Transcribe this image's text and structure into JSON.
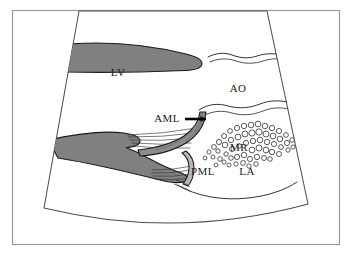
{
  "figure": {
    "kind": "echocardiography-schematic",
    "caption_absent": true,
    "frame": {
      "border_color": "#9a9a9a",
      "background_color": "#ffffff"
    },
    "sector": {
      "name": "ultrasound-sector",
      "outline_color": "#4d4d4d",
      "fill_color": "#ffffff"
    },
    "palette": {
      "myocardium_gray": "#808080",
      "leaflet_gray": "#8c8c8c",
      "outline_dark": "#1a1a1a",
      "outline_thin": "#4d4d4d",
      "bubble_stroke": "#333333",
      "arrow_black": "#000000",
      "text_color": "#1a1a1a"
    }
  },
  "labels": [
    {
      "id": "lv",
      "text": "LV",
      "x": 118,
      "y": 76,
      "size": "large"
    },
    {
      "id": "ao",
      "text": "AO",
      "x": 238,
      "y": 92,
      "size": "large"
    },
    {
      "id": "aml",
      "text": "AML",
      "x": 167,
      "y": 122,
      "size": "large"
    },
    {
      "id": "mr",
      "text": "MR",
      "x": 239,
      "y": 151,
      "size": "large"
    },
    {
      "id": "pml",
      "text": "PML",
      "x": 203,
      "y": 175,
      "size": "large"
    },
    {
      "id": "la",
      "text": "LA",
      "x": 247,
      "y": 175,
      "size": "large"
    }
  ],
  "annotations": {
    "aml_arrow": {
      "name": "aml-pointer-arrow",
      "from_x": 190,
      "from_y": 120,
      "to_x": 208,
      "to_y": 120,
      "color": "#000000"
    }
  },
  "structures": {
    "lv_anterior_wall": "upper gray myocardial band sloping down-right to a rounded tip at the aortic root",
    "lv_posterior_wall": "lower V-shaped gray myocardial band with papillary muscle",
    "anterior_mitral_leaflet": "gray curved leaflet sweeping up toward the aortic root",
    "posterior_mitral_leaflet": "short gray leaflet at the base",
    "chordae_tendineae": "fan of thin lines from papillary muscles to both leaflets",
    "aortic_root_walls": "pair of wavy lines bounding the aorta",
    "left_atrium_posterior_wall": "shallow arc bounding the left atrium inferiorly",
    "mr_jet": "cluster of small open circles representing the mitral regurgitant jet in the left atrium"
  },
  "mr_jet_bubbles": {
    "name": "mr-jet-bubble-cluster",
    "count": 58,
    "radius_min": 1.8,
    "radius_max": 3.4,
    "stroke": "#333333",
    "fill": "#ffffff",
    "points": [
      [
        209,
        152,
        2.1
      ],
      [
        214,
        147,
        2.4
      ],
      [
        213,
        157,
        2.0
      ],
      [
        219,
        142,
        2.6
      ],
      [
        218,
        151,
        2.2
      ],
      [
        220,
        159,
        2.3
      ],
      [
        224,
        136,
        2.5
      ],
      [
        225,
        145,
        2.8
      ],
      [
        226,
        154,
        2.2
      ],
      [
        224,
        162,
        2.1
      ],
      [
        230,
        131,
        2.4
      ],
      [
        231,
        140,
        2.7
      ],
      [
        232,
        149,
        2.5
      ],
      [
        231,
        158,
        2.3
      ],
      [
        229,
        165,
        2.0
      ],
      [
        237,
        128,
        2.6
      ],
      [
        238,
        137,
        2.9
      ],
      [
        239,
        146,
        2.4
      ],
      [
        237,
        157,
        2.6
      ],
      [
        236,
        164,
        2.2
      ],
      [
        244,
        126,
        2.7
      ],
      [
        245,
        134,
        3.0
      ],
      [
        246,
        143,
        2.6
      ],
      [
        244,
        155,
        2.8
      ],
      [
        243,
        163,
        2.4
      ],
      [
        251,
        125,
        2.8
      ],
      [
        252,
        133,
        3.1
      ],
      [
        253,
        141,
        2.7
      ],
      [
        252,
        150,
        2.9
      ],
      [
        250,
        159,
        2.6
      ],
      [
        249,
        166,
        2.2
      ],
      [
        258,
        124,
        2.9
      ],
      [
        259,
        132,
        3.2
      ],
      [
        260,
        140,
        2.8
      ],
      [
        259,
        148,
        3.0
      ],
      [
        257,
        157,
        2.7
      ],
      [
        256,
        164,
        2.3
      ],
      [
        265,
        126,
        2.8
      ],
      [
        266,
        134,
        3.0
      ],
      [
        267,
        142,
        2.7
      ],
      [
        266,
        150,
        2.9
      ],
      [
        264,
        158,
        2.5
      ],
      [
        272,
        128,
        2.7
      ],
      [
        273,
        136,
        2.9
      ],
      [
        274,
        144,
        2.6
      ],
      [
        272,
        152,
        2.7
      ],
      [
        270,
        159,
        2.3
      ],
      [
        279,
        131,
        2.6
      ],
      [
        280,
        139,
        2.8
      ],
      [
        281,
        147,
        2.4
      ],
      [
        279,
        154,
        2.5
      ],
      [
        286,
        135,
        2.4
      ],
      [
        287,
        143,
        2.6
      ],
      [
        288,
        150,
        2.2
      ],
      [
        292,
        140,
        2.3
      ],
      [
        293,
        147,
        2.1
      ],
      [
        216,
        165,
        1.9
      ],
      [
        205,
        158,
        1.9
      ]
    ]
  },
  "chordae_lines": {
    "name": "chordae-tendineae-lines",
    "stroke": "#333333",
    "to_anterior_leaflet": [
      [
        [
          128,
          135
        ],
        [
          197,
          128
        ]
      ],
      [
        [
          128,
          137
        ],
        [
          195,
          133
        ]
      ],
      [
        [
          130,
          140
        ],
        [
          193,
          138
        ]
      ],
      [
        [
          132,
          143
        ],
        [
          191,
          143
        ]
      ],
      [
        [
          134,
          146
        ],
        [
          190,
          148
        ]
      ]
    ],
    "to_posterior_leaflet": [
      [
        [
          152,
          170
        ],
        [
          192,
          166
        ]
      ],
      [
        [
          152,
          173
        ],
        [
          191,
          170
        ]
      ],
      [
        [
          153,
          176
        ],
        [
          191,
          174
        ]
      ],
      [
        [
          155,
          179
        ],
        [
          192,
          178
        ]
      ]
    ]
  }
}
